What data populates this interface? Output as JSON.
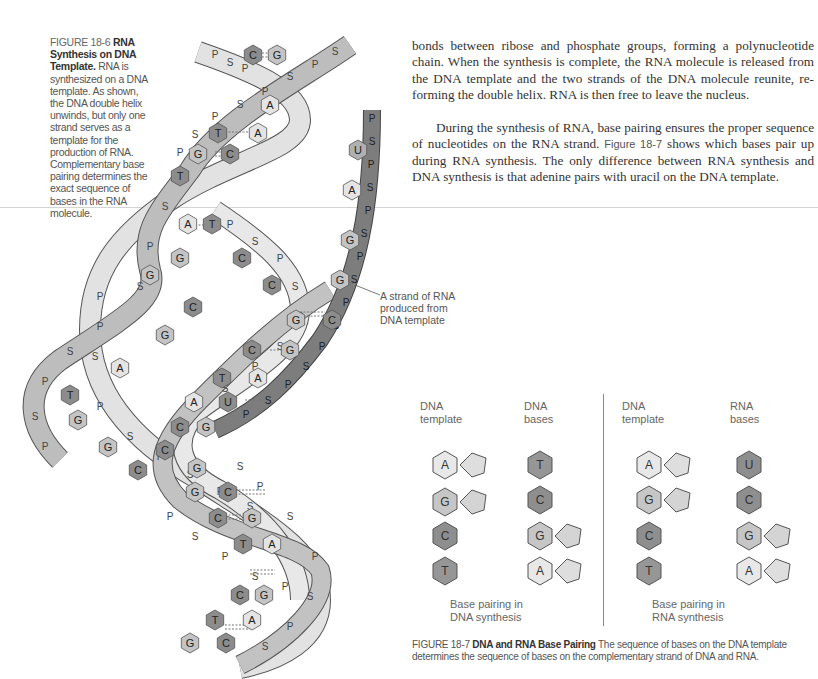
{
  "figure_18_6": {
    "number": "FIGURE 18-6",
    "title": "RNA Synthesis on DNA Template.",
    "caption": "RNA is synthesized on a DNA template. As shown, the DNA double helix unwinds, but only one strand serves as a template for the production of RNA. Complementary base pairing determines the exact sequence of bases in the RNA molecule.",
    "rna_label": [
      "A strand of RNA",
      "produced from",
      "DNA template"
    ],
    "backbone_labels": [
      "P",
      "S"
    ],
    "base_labels": [
      "A",
      "T",
      "G",
      "C",
      "U"
    ]
  },
  "body": {
    "paragraph_1": "bonds between ribose and phosphate groups, forming a polynucleotide chain. When the synthesis is complete, the RNA molecule is released from the DNA template and the two strands of the DNA molecule reunite, re-forming the double helix. RNA is then free to leave the nucleus.",
    "paragraph_2_pre": "During the synthesis of RNA, base pairing ensures the proper sequence of nucleotides on the RNA strand. ",
    "paragraph_2_ref": "Figure 18-7",
    "paragraph_2_post": " shows which bases pair up during RNA synthesis. The only difference between RNA synthesis and DNA synthesis is that adenine pairs with uracil on the DNA template."
  },
  "figure_18_7": {
    "number": "FIGURE 18-7",
    "title": "DNA and RNA Base Pairing",
    "caption": "The sequence of bases on the DNA template determines the sequence of bases on the complementary strand of DNA and RNA.",
    "left_panel": {
      "col1_header": [
        "DNA",
        "template"
      ],
      "col2_header": [
        "DNA",
        "bases"
      ],
      "template": [
        "A",
        "G",
        "C",
        "T"
      ],
      "bases": [
        "T",
        "C",
        "G",
        "A"
      ],
      "label": [
        "Base pairing in",
        "DNA synthesis"
      ]
    },
    "right_panel": {
      "col1_header": [
        "DNA",
        "template"
      ],
      "col2_header": [
        "RNA",
        "bases"
      ],
      "template": [
        "A",
        "G",
        "C",
        "T"
      ],
      "bases": [
        "U",
        "C",
        "G",
        "A"
      ],
      "label": [
        "Base pairing in",
        "RNA synthesis"
      ]
    }
  },
  "colors": {
    "purine_light": "#e4e4e4",
    "purine_mid": "#c4c4c4",
    "pyrimidine_dark": "#8c8c8c",
    "strand_light": "#dcdcdc",
    "strand_mid": "#b9b9b9",
    "rna_strand": "#7d7d7d",
    "outline": "#555555"
  }
}
